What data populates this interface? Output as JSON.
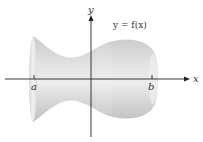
{
  "diagram": {
    "curve_label": "y = f(x)",
    "axes": {
      "x_label": "x",
      "y_label": "y"
    },
    "interval": {
      "left_label": "a",
      "right_label": "b"
    },
    "colors": {
      "axis": "#222222",
      "solid_fill": "#d9d9d9",
      "solid_highlight": "#f0f0f0",
      "solid_shadow": "#bdbdbd",
      "text": "#333333",
      "background": "#ffffff"
    }
  }
}
